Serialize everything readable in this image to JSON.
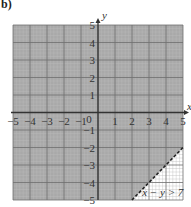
{
  "part_label": "b)",
  "chart_data": {
    "type": "area",
    "title": "",
    "xlabel": "x",
    "ylabel": "y",
    "xlim": [
      -5,
      5
    ],
    "ylim": [
      -5,
      5
    ],
    "grid": true,
    "x_ticks": [
      -5,
      -4,
      -3,
      -2,
      -1,
      0,
      1,
      2,
      3,
      4,
      5
    ],
    "y_ticks": [
      -5,
      -4,
      -3,
      -2,
      -1,
      1,
      2,
      3,
      4,
      5
    ],
    "boundary_line": {
      "equation": "x - y = 7",
      "style": "dashed",
      "points": [
        [
          2,
          -5
        ],
        [
          5,
          -2
        ]
      ]
    },
    "unshaded_region": {
      "inequality": "x - y > 7",
      "vertices": [
        [
          2,
          -5
        ],
        [
          5,
          -5
        ],
        [
          5,
          -2
        ]
      ]
    },
    "shaded_region": "rest of grid (region not satisfying x - y > 7)",
    "annotation": "x − y > 7",
    "colors": {
      "shaded": "#a9a9a9",
      "unshaded": "#ffffff",
      "major_grid": "#6e6e6e",
      "axis": "#333333"
    }
  }
}
